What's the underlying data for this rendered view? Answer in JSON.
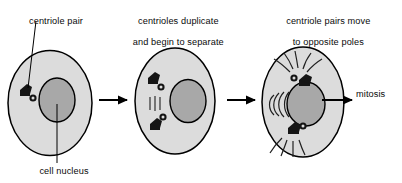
{
  "diagram": {
    "type": "biology-process-diagram",
    "background_color": "#ffffff",
    "ink_color": "#000000",
    "cytoplasm_color": "#dcdcdc",
    "nucleus_color": "#a8a8a8",
    "centriole_color": "#151515"
  },
  "captions": {
    "stage1": "centriole pair",
    "stage2_line1": "centrioles duplicate",
    "stage2_line2": "and begin to separate",
    "stage3_line1": "centriole pairs move",
    "stage3_line2": "to opposite poles"
  },
  "labels": {
    "nucleus": "cell nucleus",
    "outcome": "mitosis"
  },
  "stages": [
    {
      "id": "stage-1",
      "caption": "centriole pair",
      "centriole_pairs": 1,
      "has_spindle_fibers": false,
      "has_astral_rays": false,
      "callouts": [
        "centriole pair",
        "cell nucleus"
      ]
    },
    {
      "id": "stage-2",
      "caption": "centrioles duplicate and begin to separate",
      "centriole_pairs": 2,
      "has_spindle_fibers": true,
      "has_astral_rays": false,
      "callouts": []
    },
    {
      "id": "stage-3",
      "caption": "centriole pairs move to opposite poles",
      "centriole_pairs": 2,
      "has_spindle_fibers": true,
      "has_astral_rays": true,
      "callouts": []
    }
  ],
  "arrows": [
    {
      "id": "arrow-1-2",
      "from": "stage-1",
      "to": "stage-2",
      "label": ""
    },
    {
      "id": "arrow-2-3",
      "from": "stage-2",
      "to": "stage-3",
      "label": ""
    },
    {
      "id": "arrow-3-mitosis",
      "from": "stage-3",
      "to": "mitosis",
      "label": "mitosis"
    }
  ]
}
